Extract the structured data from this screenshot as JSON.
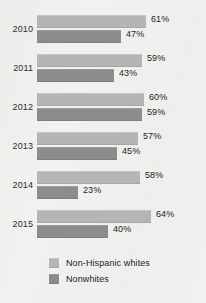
{
  "chart_data": {
    "type": "bar",
    "orientation": "horizontal",
    "title": "",
    "subtitle": "",
    "xlabel": "",
    "ylabel": "",
    "grid": false,
    "legend_position": "bottom-left",
    "xlim": [
      0,
      70
    ],
    "value_suffix": "%",
    "categories": [
      "2010",
      "2011",
      "2012",
      "2013",
      "2014",
      "2015"
    ],
    "series": [
      {
        "name": "Non-Hispanic whites",
        "color": "#b5b5b5",
        "values": [
          61,
          59,
          60,
          57,
          58,
          64
        ],
        "labels": [
          "61%",
          "59%",
          "60%",
          "57%",
          "58%",
          "64%"
        ]
      },
      {
        "name": "Nonwhites",
        "color": "#8c8c8c",
        "values": [
          47,
          43,
          59,
          45,
          23,
          40
        ],
        "labels": [
          "47%",
          "43%",
          "59%",
          "45%",
          "23%",
          "40%"
        ]
      }
    ]
  },
  "legend": {
    "items": [
      {
        "label": "Non-Hispanic whites",
        "color": "#b5b5b5"
      },
      {
        "label": "Nonwhites",
        "color": "#8c8c8c"
      }
    ]
  },
  "style": {
    "background": "#f1f1ef",
    "text_color": "#232323"
  }
}
